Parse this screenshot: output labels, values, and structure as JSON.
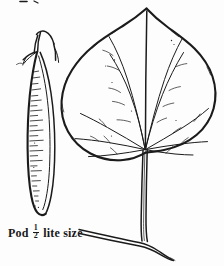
{
  "plate": {
    "title": "Botanical line drawing plate",
    "width": 224,
    "height": 266,
    "background_color": "#fdfdfd",
    "ink_color": "#1b1b1b",
    "style": "pen-and-ink engraving"
  },
  "caption": {
    "prefix": "Pod",
    "fraction_numerator": "1",
    "fraction_denominator": "2",
    "suffix": "lite size",
    "full_text": "Pod ½ lite size"
  },
  "figures": {
    "pod": {
      "label": "seed-pod",
      "description": "long slender flattened legume pod with stalk and sepals at top, interior tick hatching, rounded pointed tip",
      "orientation": "vertical",
      "position": {
        "x": 18,
        "y": 26,
        "width": 60,
        "height": 195
      }
    },
    "leaf": {
      "label": "leaf",
      "description": "broad heart-shaped cordate leaf with pointed apex, undulate margin, palmate venation radiating from base, long petiole attached to a horizontal twig",
      "vein_type": "palmate",
      "margin": "entire-undulate",
      "position": {
        "x": 62,
        "y": 6,
        "width": 160,
        "height": 255
      }
    },
    "twig": {
      "label": "twig",
      "description": "horizontal woody twig crossing lower plate, drawn as double line",
      "position": {
        "x": 78,
        "y": 228,
        "width": 110,
        "height": 30
      }
    }
  }
}
